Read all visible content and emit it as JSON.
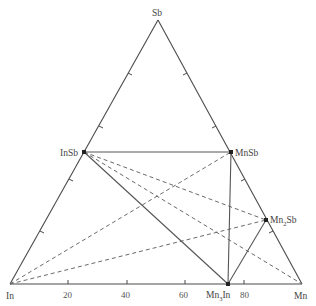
{
  "diagram": {
    "type": "ternary-phase-diagram",
    "vertices": {
      "top": "Sb",
      "left": "In",
      "right": "Mn"
    },
    "axis": {
      "bottom_ticks": [
        "20",
        "40",
        "60",
        "80"
      ]
    },
    "phases": [
      {
        "label": "InSb"
      },
      {
        "label": "MnSb"
      },
      {
        "label": "Mn",
        "sub": "2",
        "rest": "Sb"
      },
      {
        "label": "Mn",
        "sub": "3",
        "rest": "In"
      }
    ],
    "tie_lines_solid": [
      [
        "InSb",
        "MnSb"
      ],
      [
        "InSb",
        "Mn3In"
      ],
      [
        "MnSb",
        "Mn3In"
      ],
      [
        "Mn2Sb",
        "Mn3In"
      ]
    ],
    "tie_lines_dashed": [
      [
        "In",
        "MnSb"
      ],
      [
        "In",
        "Mn2Sb"
      ],
      [
        "InSb",
        "Mn2Sb"
      ],
      [
        "InSb",
        "Mn"
      ]
    ],
    "colors": {
      "line": "#4a4a4a",
      "dashed": "#6a6a6a",
      "text": "#444444"
    }
  }
}
